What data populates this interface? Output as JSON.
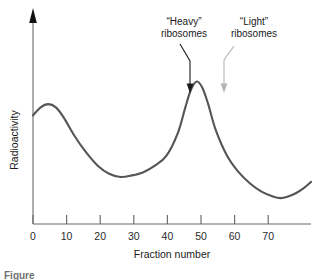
{
  "figure": {
    "caption_fragment": "Figure"
  },
  "chart_data": {
    "type": "line",
    "title": "",
    "xlabel": "Fraction number",
    "ylabel": "Radioactivity",
    "xlim": [
      0,
      73
    ],
    "ylim": [
      0,
      100
    ],
    "xticks": [
      0,
      10,
      20,
      30,
      40,
      50,
      60,
      70
    ],
    "xtick_labels": [
      "0",
      "10",
      "20",
      "30",
      "40",
      "50",
      "60",
      "70"
    ],
    "yticks": [],
    "ytick_labels": [],
    "grid": false,
    "legend": "none",
    "curve_color": "#555555",
    "axis_color": "#9a9a9a",
    "series": [
      {
        "name": "Radioactivity profile",
        "x": [
          0,
          2,
          4,
          6,
          8,
          11,
          14,
          17,
          20,
          23,
          26,
          29,
          32,
          35,
          38,
          40,
          41.5,
          43,
          44.5,
          46,
          48,
          51,
          54,
          57,
          60,
          63,
          65,
          67,
          69,
          71,
          73
        ],
        "values": [
          67,
          72,
          74,
          72,
          66,
          54,
          44,
          36,
          31,
          29,
          30,
          32,
          36,
          42,
          56,
          72,
          83,
          88,
          84,
          74,
          58,
          42,
          32,
          25,
          20,
          17,
          16,
          17,
          19,
          22,
          26
        ]
      }
    ],
    "annotations": [
      {
        "id": "heavy-annotation",
        "line1": "“Heavy”",
        "line2": "ribosomes",
        "points_to_fraction": 43,
        "color": "#1a1a1a"
      },
      {
        "id": "light-annotation",
        "line1": "“Light”",
        "line2": "ribosomes",
        "points_to_fraction": 51,
        "color": "#b3b3b3"
      }
    ]
  }
}
